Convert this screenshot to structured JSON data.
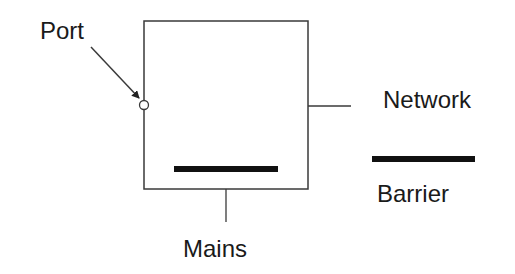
{
  "diagram": {
    "labels": {
      "port": "Port",
      "network": "Network",
      "mains": "Mains",
      "barrier": "Barrier"
    },
    "elements": {
      "device_box": {
        "x": 144,
        "y": 21,
        "width": 164,
        "height": 168
      },
      "port_circle": {
        "cx": 144,
        "cy": 105,
        "r": 4
      },
      "port_arrow": {
        "x1": 91,
        "y1": 47,
        "x2": 139,
        "y2": 98
      },
      "network_line": {
        "x1": 308,
        "y1": 106,
        "x2": 351,
        "y2": 106
      },
      "mains_line": {
        "x1": 226,
        "y1": 189,
        "x2": 226,
        "y2": 222
      },
      "internal_barrier": {
        "x1": 174,
        "y1": 169,
        "x2": 278,
        "y2": 169,
        "thickness": 6
      },
      "legend_barrier": {
        "x1": 372,
        "y1": 159,
        "x2": 475,
        "y2": 159,
        "thickness": 6
      }
    },
    "colors": {
      "stroke": "#3a3a3a",
      "barrier": "#111111",
      "text": "#1a1a1a",
      "background": "#ffffff"
    }
  }
}
